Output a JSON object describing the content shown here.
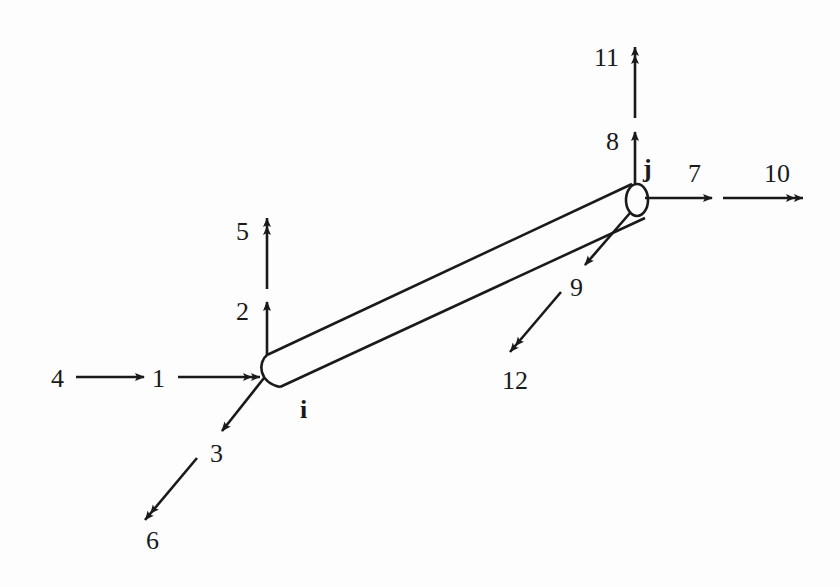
{
  "diagram": {
    "nodes": [
      {
        "id": "i",
        "label": "i"
      },
      {
        "id": "j",
        "label": "j"
      }
    ],
    "dofs": [
      {
        "num": "1",
        "node": "i",
        "type": "translation",
        "direction": "x (axial)"
      },
      {
        "num": "2",
        "node": "i",
        "type": "translation",
        "direction": "y"
      },
      {
        "num": "3",
        "node": "i",
        "type": "translation",
        "direction": "z"
      },
      {
        "num": "4",
        "node": "i",
        "type": "rotation",
        "direction": "x"
      },
      {
        "num": "5",
        "node": "i",
        "type": "rotation",
        "direction": "y"
      },
      {
        "num": "6",
        "node": "i",
        "type": "rotation",
        "direction": "z"
      },
      {
        "num": "7",
        "node": "j",
        "type": "translation",
        "direction": "x (axial)"
      },
      {
        "num": "8",
        "node": "j",
        "type": "translation",
        "direction": "y"
      },
      {
        "num": "9",
        "node": "j",
        "type": "translation",
        "direction": "z"
      },
      {
        "num": "10",
        "node": "j",
        "type": "rotation",
        "direction": "x"
      },
      {
        "num": "11",
        "node": "j",
        "type": "rotation",
        "direction": "y"
      },
      {
        "num": "12",
        "node": "j",
        "type": "rotation",
        "direction": "z"
      }
    ],
    "labels": {
      "d1": "1",
      "d2": "2",
      "d3": "3",
      "d4": "4",
      "d5": "5",
      "d6": "6",
      "d7": "7",
      "d8": "8",
      "d9": "9",
      "d10": "10",
      "d11": "11",
      "d12": "12",
      "node_i": "i",
      "node_j": "j"
    },
    "colors": {
      "stroke": "#1a1a1a",
      "background": "#fdfdfd"
    }
  }
}
